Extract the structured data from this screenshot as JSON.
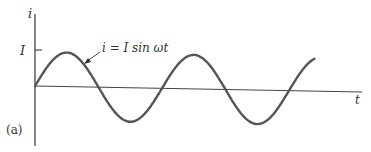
{
  "figure": {
    "panel_label": "(a)",
    "y_axis_label": "i",
    "x_axis_label": "t",
    "amplitude_tick_label": "I",
    "curve_annotation": "i = I sin ωt"
  },
  "chart_data": {
    "type": "line",
    "title": "",
    "xlabel": "t",
    "ylabel": "i",
    "function": "i = I sin(ωt)",
    "amplitude": 1,
    "cycles_shown": 2.2,
    "y_ticks": [
      {
        "value": 1,
        "label": "I"
      }
    ],
    "series": [
      {
        "name": "i = I sin ωt",
        "color": "#555555"
      }
    ]
  }
}
